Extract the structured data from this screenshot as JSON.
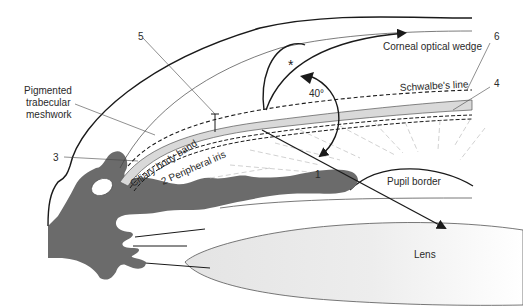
{
  "diagram": {
    "type": "gonioscopy-angle-cross-section",
    "colors": {
      "tissue": "#6b6b6b",
      "band": "#d9d9d9",
      "lens": "#ececec",
      "line": "#1a1a1a",
      "dashed_light": "#bdbdbd"
    },
    "labels": {
      "pigmented_tm_line1": "Pigmented",
      "pigmented_tm_line2": "trabecular",
      "pigmented_tm_line3": "meshwork",
      "num5": "5",
      "num6": "6",
      "num4": "4",
      "num3": "3",
      "num1": "1",
      "corneal_wedge": "Corneal optical wedge",
      "schwalbe": "Schwalbe's line",
      "angle": "40°",
      "star": "*",
      "ciliary_band": "Ciliary body band",
      "peripheral_iris": "2 Peripheral iris",
      "pupil_border": "Pupil border",
      "lens": "Lens"
    }
  }
}
